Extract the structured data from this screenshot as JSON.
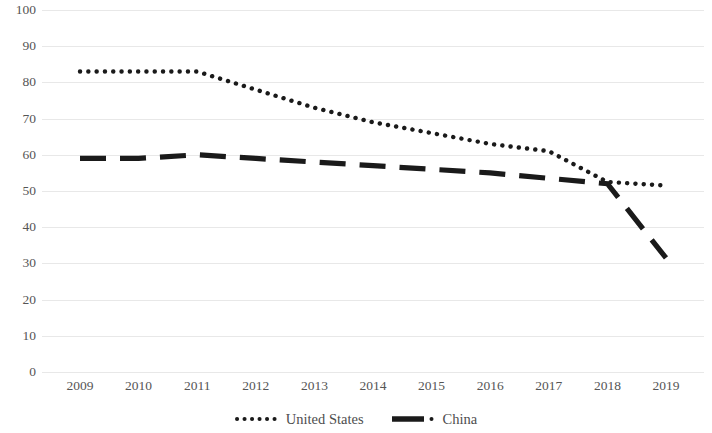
{
  "chart_data": {
    "type": "line",
    "title": "",
    "subtitle": "",
    "xlabel": "",
    "ylabel": "",
    "x": [
      "2009",
      "2010",
      "2011",
      "2012",
      "2013",
      "2014",
      "2015",
      "2016",
      "2017",
      "2018",
      "2019"
    ],
    "categories": [
      "2009",
      "2010",
      "2011",
      "2012",
      "2013",
      "2014",
      "2015",
      "2016",
      "2017",
      "2018",
      "2019"
    ],
    "series": [
      {
        "name": "United States",
        "style": "dotted",
        "color": "#1a1a1a",
        "values": [
          83,
          83,
          83,
          78,
          73,
          69,
          66,
          63,
          61,
          52.5,
          51.5
        ]
      },
      {
        "name": "China",
        "style": "dashed",
        "color": "#1a1a1a",
        "values": [
          59,
          59,
          60,
          59,
          58,
          57,
          56,
          55,
          53.5,
          52,
          31.5
        ]
      }
    ],
    "ylim": [
      0,
      100
    ],
    "yticks": [
      0,
      10,
      20,
      30,
      40,
      50,
      60,
      70,
      80,
      90,
      100
    ],
    "ytick_labels": [
      "0",
      "10",
      "20",
      "30",
      "40",
      "50",
      "60",
      "70",
      "80",
      "90",
      "100"
    ],
    "grid": true,
    "grid_axis": "y",
    "grid_color": "#e8e8e8",
    "legend_position": "bottom"
  },
  "legend": {
    "entries": [
      {
        "label": "United States",
        "marker": "dotted-line-marker"
      },
      {
        "label": "China",
        "marker": "dashed-line-marker"
      }
    ]
  }
}
